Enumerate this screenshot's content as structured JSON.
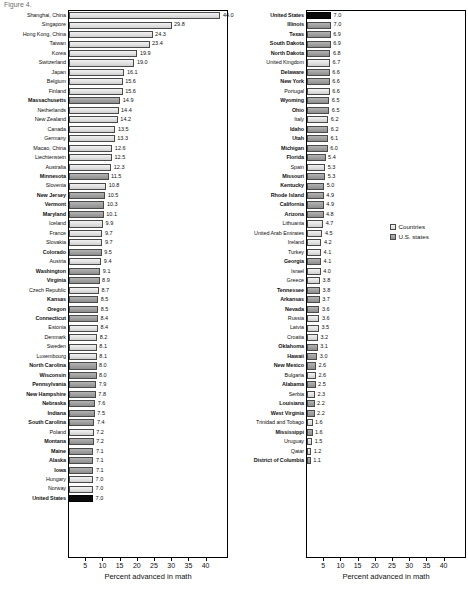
{
  "figure": {
    "title_stub": "Figure 4.",
    "axis_title": "Percent advanced in math",
    "tick_labels": [
      "5",
      "10",
      "15",
      "20",
      "25",
      "30",
      "35",
      "40"
    ],
    "tick_values": [
      5,
      10,
      15,
      20,
      25,
      30,
      35,
      40
    ]
  },
  "legend": {
    "items": [
      {
        "label": "Countries",
        "swatch": "country",
        "color": "#e4e4e4"
      },
      {
        "label": "U.S. states",
        "swatch": "state",
        "color": "#a2a2a2"
      }
    ]
  },
  "chart_data": {
    "type": "bar",
    "title": "Percent advanced in math",
    "xlabel": "Percent advanced in math",
    "ylabel": "",
    "xlim": [
      0,
      44
    ],
    "grid": false,
    "orientation": "horizontal",
    "legend_position": "right-middle",
    "series": [
      {
        "name": "Countries",
        "color": "#e4e4e4"
      },
      {
        "name": "U.S. states",
        "color": "#a2a2a2"
      },
      {
        "name": "United States",
        "color": "#0a0a0a"
      }
    ],
    "panels": [
      {
        "name": "left-column",
        "rows": [
          {
            "label": "Shanghai, China",
            "value": 44.0,
            "group": "country"
          },
          {
            "label": "Singapore",
            "value": 29.8,
            "group": "country"
          },
          {
            "label": "Hong Kong, China",
            "value": 24.3,
            "group": "country"
          },
          {
            "label": "Taiwan",
            "value": 23.4,
            "group": "country"
          },
          {
            "label": "Korea",
            "value": 19.9,
            "group": "country"
          },
          {
            "label": "Switzerland",
            "value": 19.0,
            "group": "country"
          },
          {
            "label": "Japan",
            "value": 16.1,
            "group": "country"
          },
          {
            "label": "Belgium",
            "value": 15.6,
            "group": "country"
          },
          {
            "label": "Finland",
            "value": 15.6,
            "group": "country"
          },
          {
            "label": "Massachusetts",
            "value": 14.9,
            "group": "state"
          },
          {
            "label": "Netherlands",
            "value": 14.4,
            "group": "country"
          },
          {
            "label": "New Zealand",
            "value": 14.2,
            "group": "country"
          },
          {
            "label": "Canada",
            "value": 13.5,
            "group": "country"
          },
          {
            "label": "Germany",
            "value": 13.3,
            "group": "country"
          },
          {
            "label": "Macao, China",
            "value": 12.6,
            "group": "country"
          },
          {
            "label": "Liechtenstein",
            "value": 12.5,
            "group": "country"
          },
          {
            "label": "Australia",
            "value": 12.3,
            "group": "country"
          },
          {
            "label": "Minnesota",
            "value": 11.5,
            "group": "state"
          },
          {
            "label": "Slovenia",
            "value": 10.8,
            "group": "country"
          },
          {
            "label": "New Jersey",
            "value": 10.5,
            "group": "state"
          },
          {
            "label": "Vermont",
            "value": 10.3,
            "group": "state"
          },
          {
            "label": "Maryland",
            "value": 10.1,
            "group": "state"
          },
          {
            "label": "Iceland",
            "value": 9.9,
            "group": "country"
          },
          {
            "label": "France",
            "value": 9.7,
            "group": "country"
          },
          {
            "label": "Slovakia",
            "value": 9.7,
            "group": "country"
          },
          {
            "label": "Colorado",
            "value": 9.5,
            "group": "state"
          },
          {
            "label": "Austria",
            "value": 9.4,
            "group": "country"
          },
          {
            "label": "Washington",
            "value": 9.1,
            "group": "state"
          },
          {
            "label": "Virginia",
            "value": 8.9,
            "group": "state"
          },
          {
            "label": "Czech Republic",
            "value": 8.7,
            "group": "country"
          },
          {
            "label": "Kansas",
            "value": 8.5,
            "group": "state"
          },
          {
            "label": "Oregon",
            "value": 8.5,
            "group": "state"
          },
          {
            "label": "Connecticut",
            "value": 8.4,
            "group": "state"
          },
          {
            "label": "Estonia",
            "value": 8.4,
            "group": "country"
          },
          {
            "label": "Denmark",
            "value": 8.2,
            "group": "country"
          },
          {
            "label": "Sweden",
            "value": 8.1,
            "group": "country"
          },
          {
            "label": "Luxembourg",
            "value": 8.1,
            "group": "country"
          },
          {
            "label": "North Carolina",
            "value": 8.0,
            "group": "state"
          },
          {
            "label": "Wisconsin",
            "value": 8.0,
            "group": "state"
          },
          {
            "label": "Pennsylvania",
            "value": 7.9,
            "group": "state"
          },
          {
            "label": "New Hampshire",
            "value": 7.8,
            "group": "state"
          },
          {
            "label": "Nebraska",
            "value": 7.6,
            "group": "state"
          },
          {
            "label": "Indiana",
            "value": 7.5,
            "group": "state"
          },
          {
            "label": "South Carolina",
            "value": 7.4,
            "group": "state"
          },
          {
            "label": "Poland",
            "value": 7.2,
            "group": "country"
          },
          {
            "label": "Montana",
            "value": 7.2,
            "group": "state"
          },
          {
            "label": "Maine",
            "value": 7.1,
            "group": "state"
          },
          {
            "label": "Alaska",
            "value": 7.1,
            "group": "state"
          },
          {
            "label": "Iowa",
            "value": 7.1,
            "group": "state"
          },
          {
            "label": "Hungary",
            "value": 7.0,
            "group": "country"
          },
          {
            "label": "Norway",
            "value": 7.0,
            "group": "country"
          },
          {
            "label": "United States",
            "value": 7.0,
            "group": "us"
          }
        ]
      },
      {
        "name": "right-column",
        "rows": [
          {
            "label": "United States",
            "value": 7.0,
            "group": "us"
          },
          {
            "label": "Illinois",
            "value": 7.0,
            "group": "state"
          },
          {
            "label": "Texas",
            "value": 6.9,
            "group": "state"
          },
          {
            "label": "South Dakota",
            "value": 6.9,
            "group": "state"
          },
          {
            "label": "North Dakota",
            "value": 6.8,
            "group": "state"
          },
          {
            "label": "United Kingdom",
            "value": 6.7,
            "group": "country"
          },
          {
            "label": "Delaware",
            "value": 6.6,
            "group": "state"
          },
          {
            "label": "New York",
            "value": 6.6,
            "group": "state"
          },
          {
            "label": "Portugal",
            "value": 6.6,
            "group": "country"
          },
          {
            "label": "Wyoming",
            "value": 6.5,
            "group": "state"
          },
          {
            "label": "Ohio",
            "value": 6.5,
            "group": "state"
          },
          {
            "label": "Italy",
            "value": 6.2,
            "group": "country"
          },
          {
            "label": "Idaho",
            "value": 6.2,
            "group": "state"
          },
          {
            "label": "Utah",
            "value": 6.1,
            "group": "state"
          },
          {
            "label": "Michigan",
            "value": 6.0,
            "group": "state"
          },
          {
            "label": "Florida",
            "value": 5.4,
            "group": "state"
          },
          {
            "label": "Spain",
            "value": 5.3,
            "group": "country"
          },
          {
            "label": "Missouri",
            "value": 5.3,
            "group": "state"
          },
          {
            "label": "Kentucky",
            "value": 5.0,
            "group": "state"
          },
          {
            "label": "Rhode Island",
            "value": 4.9,
            "group": "state"
          },
          {
            "label": "California",
            "value": 4.9,
            "group": "state"
          },
          {
            "label": "Arizona",
            "value": 4.8,
            "group": "state"
          },
          {
            "label": "Lithuania",
            "value": 4.7,
            "group": "country"
          },
          {
            "label": "United Arab Emirates",
            "value": 4.5,
            "group": "country"
          },
          {
            "label": "Ireland",
            "value": 4.2,
            "group": "country"
          },
          {
            "label": "Turkey",
            "value": 4.1,
            "group": "country"
          },
          {
            "label": "Georgia",
            "value": 4.1,
            "group": "state"
          },
          {
            "label": "Israel",
            "value": 4.0,
            "group": "country"
          },
          {
            "label": "Greece",
            "value": 3.8,
            "group": "country"
          },
          {
            "label": "Tennessee",
            "value": 3.8,
            "group": "state"
          },
          {
            "label": "Arkansas",
            "value": 3.7,
            "group": "state"
          },
          {
            "label": "Nevada",
            "value": 3.6,
            "group": "state"
          },
          {
            "label": "Russia",
            "value": 3.6,
            "group": "country"
          },
          {
            "label": "Latvia",
            "value": 3.5,
            "group": "country"
          },
          {
            "label": "Croatia",
            "value": 3.2,
            "group": "country"
          },
          {
            "label": "Oklahoma",
            "value": 3.1,
            "group": "state"
          },
          {
            "label": "Hawaii",
            "value": 3.0,
            "group": "state"
          },
          {
            "label": "New Mexico",
            "value": 2.6,
            "group": "state"
          },
          {
            "label": "Bulgaria",
            "value": 2.6,
            "group": "country"
          },
          {
            "label": "Alabama",
            "value": 2.5,
            "group": "state"
          },
          {
            "label": "Serbia",
            "value": 2.3,
            "group": "country"
          },
          {
            "label": "Louisiana",
            "value": 2.2,
            "group": "state"
          },
          {
            "label": "West Virginia",
            "value": 2.2,
            "group": "state"
          },
          {
            "label": "Trinidad and Tobago",
            "value": 1.6,
            "group": "country"
          },
          {
            "label": "Mississippi",
            "value": 1.6,
            "group": "state"
          },
          {
            "label": "Uruguay",
            "value": 1.5,
            "group": "country"
          },
          {
            "label": "Qatar",
            "value": 1.2,
            "group": "country"
          },
          {
            "label": "District of Columbia",
            "value": 1.1,
            "group": "state"
          }
        ]
      }
    ]
  }
}
